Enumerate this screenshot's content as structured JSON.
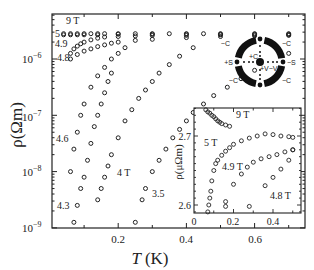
{
  "chart_data": [
    {
      "type": "scatter",
      "title": "",
      "xlabel": "T (K)",
      "ylabel": "ρ(Ωm)",
      "xlim": [
        0,
        0.74
      ],
      "ylim_log10": [
        -9,
        -5.25
      ],
      "yscale": "log",
      "grid": false,
      "xticks": [
        0.2,
        0.4,
        0.6
      ],
      "xtick_labels": [
        "0.2",
        "0.4",
        "0.6"
      ],
      "yticks_log10": [
        -6,
        -7,
        -8,
        -9
      ],
      "ytick_labels": [
        "10^-6",
        "10^-7",
        "10^-8",
        "10^-9"
      ],
      "marker": "open circle",
      "series": [
        {
          "name": "9 T",
          "label": "9 T",
          "x": [
            0.04,
            0.06,
            0.08,
            0.1,
            0.12,
            0.14,
            0.16,
            0.2,
            0.25,
            0.3,
            0.35,
            0.4,
            0.45,
            0.5,
            0.6,
            0.7
          ],
          "log10_y": [
            -5.55,
            -5.55,
            -5.55,
            -5.55,
            -5.55,
            -5.55,
            -5.55,
            -5.55,
            -5.55,
            -5.55,
            -5.55,
            -5.55,
            -5.55,
            -5.55,
            -5.55,
            -5.55
          ]
        },
        {
          "name": "5 T",
          "label": "5",
          "x": [
            0.04,
            0.06,
            0.08,
            0.1,
            0.14,
            0.2,
            0.3,
            0.4,
            0.5,
            0.6,
            0.7
          ],
          "log10_y": [
            -5.57,
            -5.57,
            -5.57,
            -5.57,
            -5.57,
            -5.56,
            -5.56,
            -5.56,
            -5.56,
            -5.56,
            -5.56
          ]
        },
        {
          "name": "4.9 T",
          "label": "4.9",
          "x": [
            0.06,
            0.07,
            0.08,
            0.09,
            0.1,
            0.12,
            0.14,
            0.16,
            0.2,
            0.25,
            0.3,
            0.4,
            0.5,
            0.6,
            0.7
          ],
          "log10_y": [
            -5.9,
            -5.82,
            -5.77,
            -5.73,
            -5.7,
            -5.66,
            -5.63,
            -5.61,
            -5.6,
            -5.59,
            -5.58,
            -5.58,
            -5.57,
            -5.57,
            -5.57
          ]
        },
        {
          "name": "4.8 T",
          "label": "4.8",
          "x": [
            0.06,
            0.08,
            0.1,
            0.12,
            0.14,
            0.16,
            0.18,
            0.2,
            0.25,
            0.3,
            0.4,
            0.5,
            0.6,
            0.7
          ],
          "log10_y": [
            -6.0,
            -5.92,
            -5.86,
            -5.82,
            -5.78,
            -5.75,
            -5.72,
            -5.7,
            -5.67,
            -5.65,
            -5.62,
            -5.6,
            -5.59,
            -5.58
          ]
        },
        {
          "name": "4.6 T",
          "label": "4.6",
          "x": [
            0.06,
            0.07,
            0.08,
            0.09,
            0.1,
            0.12,
            0.14,
            0.16,
            0.18,
            0.2,
            0.22
          ],
          "log10_y": [
            -8.0,
            -7.6,
            -7.3,
            -7.0,
            -6.8,
            -6.5,
            -6.3,
            -6.15,
            -6.0,
            -5.9,
            -5.8
          ]
        },
        {
          "name": "4.3 T",
          "label": "4.3",
          "x": [
            0.07,
            0.08,
            0.09,
            0.1,
            0.11,
            0.12,
            0.13,
            0.14,
            0.15,
            0.16,
            0.17,
            0.18
          ],
          "log10_y": [
            -8.9,
            -8.6,
            -8.3,
            -8.1,
            -7.8,
            -7.5,
            -7.2,
            -7.0,
            -6.8,
            -6.6,
            -6.4,
            -6.25
          ]
        },
        {
          "name": "4 T",
          "label": "4 T",
          "x": [
            0.14,
            0.15,
            0.16,
            0.17,
            0.18,
            0.2,
            0.22,
            0.24,
            0.26,
            0.28,
            0.3,
            0.32,
            0.35,
            0.38,
            0.42
          ],
          "log10_y": [
            -8.5,
            -8.3,
            -8.1,
            -7.9,
            -7.7,
            -7.4,
            -7.1,
            -6.9,
            -6.7,
            -6.55,
            -6.4,
            -6.25,
            -6.1,
            -5.95,
            -5.8
          ]
        },
        {
          "name": "3.5 T",
          "label": "3.5",
          "x": [
            0.25,
            0.27,
            0.28,
            0.3,
            0.32,
            0.34,
            0.36,
            0.38,
            0.4,
            0.42,
            0.45,
            0.48,
            0.52,
            0.56,
            0.6,
            0.7
          ],
          "log10_y": [
            -8.9,
            -8.5,
            -8.3,
            -8.0,
            -7.8,
            -7.6,
            -7.4,
            -7.25,
            -7.1,
            -6.95,
            -6.8,
            -6.65,
            -6.5,
            -6.35,
            -6.2,
            -5.9
          ]
        }
      ],
      "annotations": [
        "9 T",
        "5",
        "4.9",
        "4.8",
        "4.6",
        "4 T",
        "3.5",
        "4.3"
      ]
    },
    {
      "type": "scatter",
      "title": "inset",
      "xlabel": "",
      "ylabel": "ρ(μΩm)",
      "xlim": [
        0,
        0.52
      ],
      "ylim": [
        2.585,
        2.74
      ],
      "xticks": [
        0,
        0.2,
        0.4
      ],
      "xtick_labels": [
        "0",
        "0.2",
        "0.4"
      ],
      "yticks": [
        2.6,
        2.7
      ],
      "ytick_labels": [
        "2.6",
        "2.7"
      ],
      "series": [
        {
          "name": "9 T",
          "x": [
            0.06,
            0.07,
            0.08,
            0.09,
            0.1,
            0.11,
            0.12,
            0.13,
            0.14,
            0.16,
            0.18
          ],
          "y": [
            2.738,
            2.735,
            2.733,
            2.73,
            2.728,
            2.725,
            2.722,
            2.72,
            2.718,
            2.716,
            2.714
          ]
        },
        {
          "name": "5 T",
          "x": [
            0.07,
            0.075,
            0.08,
            0.085,
            0.09,
            0.1,
            0.11,
            0.12,
            0.14,
            0.16,
            0.18,
            0.2,
            0.24,
            0.28,
            0.32,
            0.36,
            0.4,
            0.44,
            0.48,
            0.5
          ],
          "y": [
            2.59,
            2.6,
            2.61,
            2.62,
            2.635,
            2.65,
            2.66,
            2.665,
            2.672,
            2.678,
            2.683,
            2.688,
            2.693,
            2.697,
            2.7,
            2.703,
            2.702,
            2.7,
            2.699,
            2.698
          ]
        },
        {
          "name": "4.9 T",
          "x": [
            0.16,
            0.2,
            0.24,
            0.27,
            0.3,
            0.34,
            0.38,
            0.42,
            0.46,
            0.5
          ],
          "y": [
            2.605,
            2.63,
            2.645,
            2.655,
            2.662,
            2.667,
            2.67,
            2.673,
            2.677,
            2.68
          ]
        },
        {
          "name": "4.8 T",
          "x": [
            0.16,
            0.28,
            0.36,
            0.4,
            0.44,
            0.48,
            0.5
          ],
          "y": [
            2.598,
            2.598,
            2.628,
            2.64,
            2.652,
            2.665,
            2.68
          ]
        }
      ],
      "annotations": [
        "9 T",
        "5 T",
        "4.9 T",
        "4.8 T"
      ]
    }
  ],
  "figure": {
    "main_xlabel_italic": "T",
    "main_xlabel_unit": "(K)",
    "main_ylabel": "ρ(Ωm)",
    "main_xtick_labels": [
      "0.2",
      "0.4",
      "0.6"
    ],
    "main_ytick_labels": [
      {
        "base": "10",
        "exp": "−6"
      },
      {
        "base": "10",
        "exp": "−7"
      },
      {
        "base": "10",
        "exp": "−8"
      },
      {
        "base": "10",
        "exp": "−9"
      }
    ],
    "curve_labels": {
      "t9": "9 T",
      "t5": "5",
      "t49": "4.9",
      "t48": "4.8",
      "t46": "4.6",
      "t4": "4 T",
      "t35": "3.5",
      "t43": "4.3"
    },
    "inset": {
      "ylabel": "ρ(μΩm)",
      "ytick_labels": [
        "2.7",
        "2.6"
      ],
      "xtick_labels": [
        "0",
        "0.2",
        "0.4"
      ],
      "curve_labels": {
        "t9": "9 T",
        "t5": "5 T",
        "t49": "4.9 T",
        "t48": "4.8 T"
      }
    },
    "contact_diagram": {
      "labels": {
        "c_tl": "−C",
        "c_tr": "−C",
        "c_bl": "−C",
        "c_br": "−C",
        "s_left": "+S",
        "s_right": "−S",
        "c_plus": "+C",
        "v": "+V−V"
      }
    }
  }
}
